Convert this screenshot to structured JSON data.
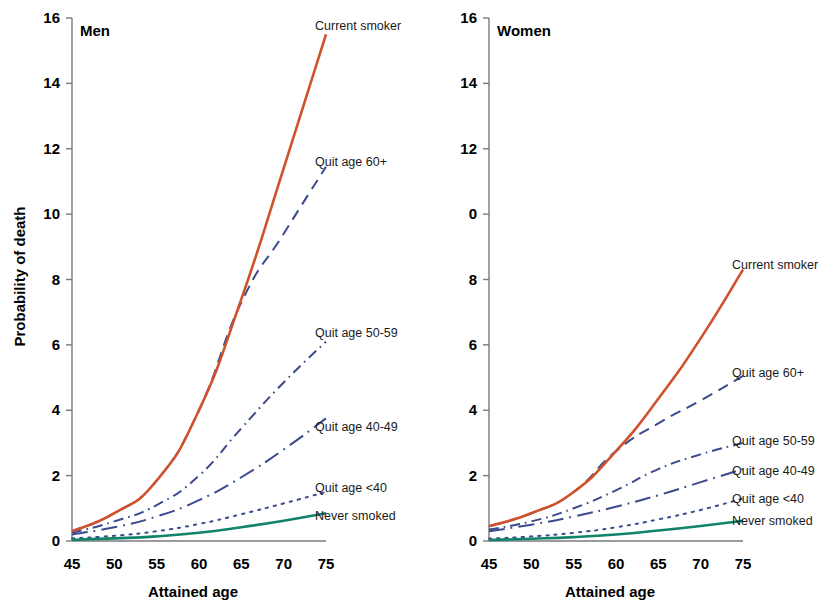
{
  "figure": {
    "background": "#ffffff",
    "width": 833,
    "height": 610
  },
  "panels": [
    {
      "key": "men",
      "title": "Men",
      "ylabel": "Probability of death",
      "xlabel": "Attained age"
    },
    {
      "key": "women",
      "title": "Women",
      "ylabel": "",
      "xlabel": "Attained age"
    }
  ],
  "axis": {
    "ylabel": "Probability of death",
    "xlabel": "Attained age",
    "x_ticks": [
      45,
      50,
      55,
      60,
      65,
      70,
      75
    ],
    "x_tick_labels": [
      "45",
      "50",
      "55",
      "60",
      "65",
      "70",
      "75"
    ],
    "y_ticks": [
      0,
      2,
      4,
      6,
      8,
      10,
      12,
      14,
      16
    ],
    "y_tick_labels_men": [
      "0",
      "2",
      "4",
      "6",
      "8",
      "10",
      "12",
      "14",
      "16"
    ],
    "y_tick_labels_women": [
      "0",
      "2",
      "4",
      "6",
      "8",
      "0",
      "12",
      "14",
      "16"
    ],
    "xlim": [
      45,
      75
    ],
    "ylim": [
      0,
      16
    ]
  },
  "colors": {
    "current_smoker": "#d0512b",
    "quit": "#3b4a8c",
    "never_smoked": "#10836a",
    "axis": "#7a7a7a",
    "text": "#000000"
  },
  "chart_data": {
    "type": "line",
    "xlabel": "Attained age",
    "ylabel": "Probability of death",
    "xlim": [
      45,
      75
    ],
    "ylim": [
      0,
      16
    ],
    "x": [
      45,
      50,
      55,
      60,
      65,
      70,
      75
    ],
    "grid": false,
    "legend": "inline-right-labels",
    "panels": [
      {
        "name": "Men",
        "series": [
          {
            "name": "Current smoker",
            "color": "#d0512b",
            "style": "solid",
            "values": [
              0.3,
              0.85,
              1.85,
              4.0,
              7.4,
              11.4,
              15.5
            ]
          },
          {
            "name": "Quit age 60+",
            "color": "#3b4a8c",
            "style": "dashed",
            "values": [
              0.3,
              0.85,
              1.85,
              4.0,
              7.3,
              9.4,
              11.45
            ]
          },
          {
            "name": "Quit age 50-59",
            "color": "#3b4a8c",
            "style": "dash-dot-dot",
            "values": [
              0.25,
              0.6,
              1.1,
              2.0,
              3.45,
              4.85,
              6.1
            ]
          },
          {
            "name": "Quit age 40-49",
            "color": "#3b4a8c",
            "style": "long-dash-dot",
            "values": [
              0.2,
              0.42,
              0.75,
              1.25,
              1.95,
              2.8,
              3.75
            ]
          },
          {
            "name": "Quit age <40",
            "color": "#3b4a8c",
            "style": "dotted",
            "values": [
              0.08,
              0.16,
              0.3,
              0.52,
              0.82,
              1.15,
              1.5
            ]
          },
          {
            "name": "Never smoked",
            "color": "#10836a",
            "style": "solid",
            "values": [
              0.04,
              0.08,
              0.14,
              0.25,
              0.42,
              0.62,
              0.85
            ]
          }
        ]
      },
      {
        "name": "Women",
        "series": [
          {
            "name": "Current smoker",
            "color": "#d0512b",
            "style": "solid",
            "values": [
              0.45,
              0.85,
              1.5,
              2.75,
              4.35,
              6.2,
              8.3
            ]
          },
          {
            "name": "Quit age 60+",
            "color": "#3b4a8c",
            "style": "dashed",
            "values": [
              0.45,
              0.85,
              1.5,
              2.75,
              3.6,
              4.3,
              5.05
            ]
          },
          {
            "name": "Quit age 50-59",
            "color": "#3b4a8c",
            "style": "dash-dot-dot",
            "values": [
              0.35,
              0.6,
              1.0,
              1.55,
              2.2,
              2.65,
              3.0
            ]
          },
          {
            "name": "Quit age 40-49",
            "color": "#3b4a8c",
            "style": "long-dash-dot",
            "values": [
              0.3,
              0.5,
              0.75,
              1.05,
              1.4,
              1.8,
              2.2
            ]
          },
          {
            "name": "Quit age <40",
            "color": "#3b4a8c",
            "style": "dotted",
            "values": [
              0.07,
              0.14,
              0.25,
              0.42,
              0.66,
              0.95,
              1.3
            ]
          },
          {
            "name": "Never smoked",
            "color": "#10836a",
            "style": "solid",
            "values": [
              0.03,
              0.07,
              0.12,
              0.2,
              0.32,
              0.46,
              0.62
            ]
          }
        ]
      }
    ]
  },
  "series_labels": {
    "men": [
      {
        "text": "Current smoker",
        "x": 315,
        "y": 19
      },
      {
        "text": "Quit age 60+",
        "x": 315,
        "y": 155
      },
      {
        "text": "Quit age 50-59",
        "x": 315,
        "y": 326
      },
      {
        "text": "Quit age 40-49",
        "x": 315,
        "y": 420
      },
      {
        "text": "Quit age <40",
        "x": 315,
        "y": 481
      },
      {
        "text": "Never smoked",
        "x": 315,
        "y": 509
      }
    ],
    "women": [
      {
        "text": "Current smoker",
        "x": 315,
        "y": 258
      },
      {
        "text": "Quit age 60+",
        "x": 315,
        "y": 366
      },
      {
        "text": "Quit age 50-59",
        "x": 315,
        "y": 434
      },
      {
        "text": "Quit age 40-49",
        "x": 315,
        "y": 464
      },
      {
        "text": "Quit age <40",
        "x": 315,
        "y": 492
      },
      {
        "text": "Never smoked",
        "x": 315,
        "y": 514
      }
    ]
  }
}
